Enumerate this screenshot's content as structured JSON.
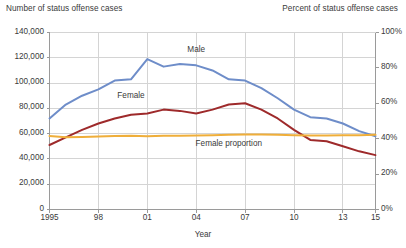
{
  "chart_data": {
    "type": "line",
    "title": "",
    "xlabel": "Year",
    "ylabel": "Number of status offense cases",
    "y2label": "Percent of status offense cases",
    "grid": true,
    "legend_position": "inline-annotations",
    "x": [
      1995,
      1996,
      1997,
      1998,
      1999,
      2000,
      2001,
      2002,
      2003,
      2004,
      2005,
      2006,
      2007,
      2008,
      2009,
      2010,
      2011,
      2012,
      2013,
      2014,
      2015
    ],
    "xlim": [
      1995,
      2015
    ],
    "ylim": [
      0,
      140000
    ],
    "y2lim": [
      0,
      100
    ],
    "x_tick_values": [
      1995,
      1998,
      2001,
      2004,
      2007,
      2010,
      2013,
      2015
    ],
    "x_tick_labels": [
      "1995",
      "98",
      "01",
      "04",
      "07",
      "10",
      "13",
      "15"
    ],
    "y_tick_values": [
      0,
      20000,
      40000,
      60000,
      80000,
      100000,
      120000,
      140000
    ],
    "y_tick_labels": [
      "0",
      "20,000",
      "40,000",
      "60,000",
      "80,000",
      "100,000",
      "120,000",
      "140,000"
    ],
    "y2_tick_values": [
      0,
      20,
      40,
      60,
      80,
      100
    ],
    "y2_tick_labels": [
      "0%",
      "20%",
      "40%",
      "60%",
      "80%",
      "100%"
    ],
    "series": [
      {
        "name": "Male",
        "axis": "left",
        "color": "#6E8DC9",
        "label_x": 2004,
        "label_y": 126000,
        "values": [
          72000,
          83000,
          90000,
          95000,
          102000,
          103000,
          119000,
          113000,
          115000,
          114000,
          110000,
          103000,
          102000,
          96000,
          88000,
          79000,
          73000,
          72000,
          68000,
          62000,
          58000
        ]
      },
      {
        "name": "Female",
        "axis": "left",
        "color": "#9E2A2B",
        "label_x": 2000,
        "label_y": 90000,
        "values": [
          51000,
          57000,
          63000,
          68000,
          72000,
          75000,
          76000,
          79000,
          78000,
          76000,
          79000,
          83000,
          84000,
          79000,
          72000,
          63000,
          55000,
          54000,
          50000,
          46000,
          43000
        ]
      },
      {
        "name": "Female proportion",
        "axis": "right",
        "color": "#EFAE3A",
        "label_x": 2006,
        "label_y": 52000,
        "values": [
          41.5,
          40.8,
          41.0,
          41.3,
          41.5,
          41.6,
          41.4,
          41.6,
          41.6,
          41.8,
          42.0,
          42.2,
          42.4,
          42.4,
          42.2,
          42.0,
          41.8,
          41.8,
          41.9,
          42.0,
          42.2
        ]
      }
    ]
  }
}
